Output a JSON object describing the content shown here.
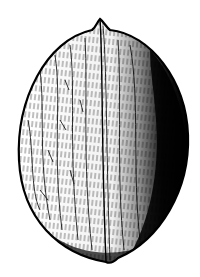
{
  "image": {
    "subject": "walnut illustration",
    "style": "black-and-white engraving",
    "colors": {
      "ink": "#000000",
      "paper": "#ffffff",
      "shadow": "#111111"
    }
  }
}
